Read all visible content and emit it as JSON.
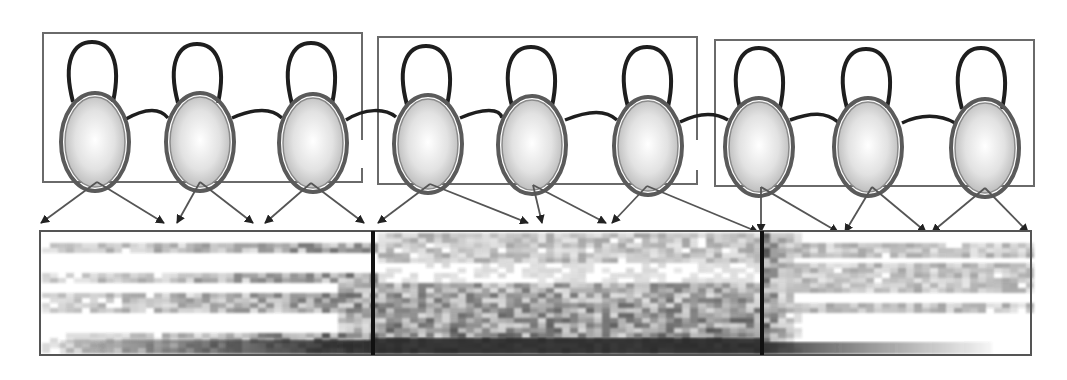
{
  "diagram": {
    "type": "hmm-phone-model-to-spectrogram-alignment",
    "phone_models": [
      {
        "id": "phone-1",
        "box": [
          43,
          33,
          362,
          182
        ],
        "states": [
          {
            "cx": 95,
            "cy": 142
          },
          {
            "cx": 200,
            "cy": 142
          },
          {
            "cx": 313,
            "cy": 143
          }
        ]
      },
      {
        "id": "phone-2",
        "box": [
          378,
          37,
          697,
          184
        ],
        "states": [
          {
            "cx": 428,
            "cy": 144
          },
          {
            "cx": 532,
            "cy": 145
          },
          {
            "cx": 648,
            "cy": 146
          }
        ]
      },
      {
        "id": "phone-3",
        "box": [
          715,
          40,
          1034,
          186
        ],
        "states": [
          {
            "cx": 757,
            "cy": 147
          },
          {
            "cx": 870,
            "cy": 147
          },
          {
            "cx": 987,
            "cy": 148
          }
        ]
      }
    ],
    "emission_arrows": [
      {
        "from": [
          95,
          182
        ],
        "to": [
          40,
          224
        ]
      },
      {
        "from": [
          95,
          182
        ],
        "to": [
          164,
          224
        ]
      },
      {
        "from": [
          200,
          182
        ],
        "to": [
          176,
          224
        ]
      },
      {
        "from": [
          200,
          182
        ],
        "to": [
          253,
          224
        ]
      },
      {
        "from": [
          313,
          183
        ],
        "to": [
          264,
          224
        ]
      },
      {
        "from": [
          313,
          183
        ],
        "to": [
          364,
          224
        ]
      },
      {
        "from": [
          428,
          184
        ],
        "to": [
          377,
          224
        ]
      },
      {
        "from": [
          428,
          184
        ],
        "to": [
          527,
          224
        ]
      },
      {
        "from": [
          532,
          185
        ],
        "to": [
          541,
          224
        ]
      },
      {
        "from": [
          532,
          185
        ],
        "to": [
          606,
          224
        ]
      },
      {
        "from": [
          648,
          186
        ],
        "to": [
          612,
          224
        ]
      },
      {
        "from": [
          648,
          186
        ],
        "to": [
          756,
          232
        ]
      },
      {
        "from": [
          762,
          187
        ],
        "to": [
          762,
          232
        ]
      },
      {
        "from": [
          762,
          187
        ],
        "to": [
          840,
          232
        ]
      },
      {
        "from": [
          870,
          187
        ],
        "to": [
          845,
          232
        ]
      },
      {
        "from": [
          870,
          187
        ],
        "to": [
          927,
          232
        ]
      },
      {
        "from": [
          987,
          188
        ],
        "to": [
          932,
          232
        ]
      },
      {
        "from": [
          987,
          188
        ],
        "to": [
          1029,
          232
        ]
      }
    ],
    "spectrogram": {
      "frame": [
        40,
        231,
        1031,
        355
      ],
      "segment_boundaries_x": [
        373,
        762
      ],
      "segments": [
        "segment-1",
        "segment-2",
        "segment-3"
      ]
    },
    "colors": {
      "box_stroke": "#6a6a6a",
      "loop_stroke": "#1e1e1e",
      "state_fill_center": "#ffffff",
      "state_fill_edge": "#b8b8b8",
      "spectrogram_ink": "#3a3a3a",
      "divider": "#111111"
    }
  }
}
